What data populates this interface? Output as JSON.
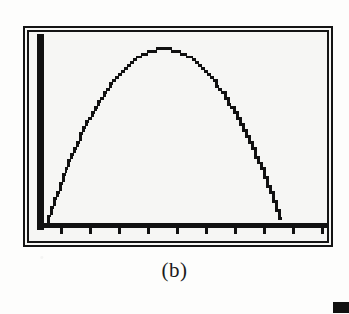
{
  "figure": {
    "caption": "(b)",
    "kind": "graphing-calculator-screen",
    "background_color": "#f6f6f4",
    "ink_color": "#111111",
    "page_color": "#fdfdfc"
  },
  "screen": {
    "frame_style": "double-rule",
    "y_axis_label": "y-axis",
    "x_axis_label": "x-axis",
    "x_tick_count": 10,
    "x_tick_positions_pct": [
      10.3,
      20.0,
      29.7,
      39.3,
      49.0,
      58.7,
      68.3,
      78.0,
      87.7,
      97.3
    ]
  },
  "artifact": {
    "label": "scan-mark"
  },
  "chart_data": {
    "type": "line",
    "title": "",
    "subtitle": "",
    "xlabel": "",
    "ylabel": "",
    "legend": [],
    "grid": false,
    "axes_visible": true,
    "curve_name": "downward parabola",
    "xlim": [
      0,
      100
    ],
    "ylim": [
      0,
      100
    ],
    "x": [
      3,
      6,
      9,
      12,
      15,
      18,
      21,
      24,
      27,
      30,
      33,
      36,
      39,
      42,
      45,
      48,
      51,
      54,
      57,
      60,
      63,
      66,
      69,
      72,
      75,
      78,
      81,
      84,
      85
    ],
    "y": [
      2,
      13,
      24,
      34,
      43,
      52,
      60,
      67,
      74,
      79,
      84,
      88,
      91,
      93,
      94,
      94,
      93,
      91,
      88,
      84,
      79,
      73,
      66,
      58,
      49,
      39,
      27,
      11,
      1
    ],
    "vertex": [
      46,
      94
    ],
    "x_intercepts": [
      2.5,
      85
    ]
  }
}
